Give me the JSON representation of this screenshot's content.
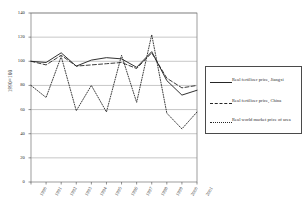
{
  "chart_data": {
    "type": "line",
    "title": "",
    "xlabel": "",
    "ylabel": "1990=100",
    "ylim": [
      0,
      140
    ],
    "yticks": [
      0,
      20,
      40,
      60,
      80,
      100,
      120,
      140
    ],
    "grid": true,
    "legend_position": "right-outside",
    "categories": [
      "1990",
      "1991",
      "1992",
      "1993",
      "1994",
      "1995",
      "1996",
      "1997",
      "1998",
      "1999",
      "2000",
      "2001"
    ],
    "x": [
      "1990",
      "1991",
      "1992",
      "1993",
      "1994",
      "1995",
      "1996",
      "1997",
      "1998",
      "1999",
      "2000",
      "2001"
    ],
    "series": [
      {
        "name": "Real fertilizer price, Jiangxi",
        "style": "solid",
        "color": "#262626",
        "values": [
          100,
          99,
          107,
          96,
          101,
          103,
          102,
          95,
          108,
          84,
          72,
          76
        ]
      },
      {
        "name": "Real fertilizer price, China",
        "style": "dashed",
        "color": "#262626",
        "values": [
          100,
          97,
          105,
          96,
          97,
          98,
          99,
          94,
          107,
          86,
          78,
          80
        ]
      },
      {
        "name": "Real world market price of urea",
        "style": "dotted",
        "color": "#262626",
        "values": [
          80,
          70,
          104,
          59,
          80,
          58,
          105,
          66,
          122,
          57,
          44,
          58
        ]
      }
    ]
  },
  "axis": {
    "y_title": "1990=100",
    "y_ticks": [
      "140",
      "120",
      "100",
      "80",
      "60",
      "40",
      "20",
      "0"
    ],
    "x_ticks": [
      "1990",
      "1991",
      "1992",
      "1993",
      "1994",
      "1995",
      "1996",
      "1997",
      "1998",
      "1999",
      "2000",
      "2001"
    ]
  },
  "legend": {
    "entries": [
      {
        "label": "Real fertilizer price, Jiangxi",
        "sample": "solid-line-sample"
      },
      {
        "label": "Real fertilizer price, China",
        "sample": "dashed-line-sample"
      },
      {
        "label": "Real world market price of urea",
        "sample": "dotted-line-sample"
      }
    ]
  }
}
